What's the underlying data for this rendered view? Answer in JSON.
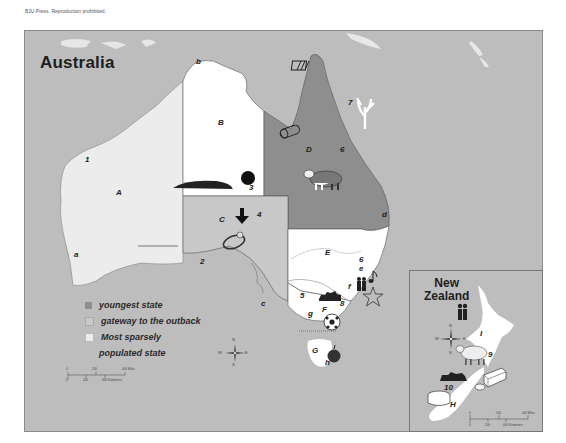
{
  "copyright": "BJU Press. Reproduction prohibited.",
  "map": {
    "title": "Australia",
    "colors": {
      "ocean": "#bdbdbd",
      "youngest_state": "#8e8e8e",
      "gateway_outback": "#c8c8c8",
      "sparsely_populated": "#ececec",
      "white_regions": "#ffffff"
    },
    "region_labels": [
      {
        "id": "A",
        "x": 116,
        "y": 192
      },
      {
        "id": "B",
        "x": 218,
        "y": 122
      },
      {
        "id": "C",
        "x": 219,
        "y": 219
      },
      {
        "id": "D",
        "x": 306,
        "y": 148
      },
      {
        "id": "E",
        "x": 325,
        "y": 250
      },
      {
        "id": "F",
        "x": 322,
        "y": 315
      },
      {
        "id": "G",
        "x": 312,
        "y": 346
      }
    ],
    "lowercase_labels": [
      {
        "id": "a",
        "x": 74,
        "y": 253
      },
      {
        "id": "b",
        "x": 196,
        "y": 60
      },
      {
        "id": "c",
        "x": 260,
        "y": 300
      },
      {
        "id": "d",
        "x": 381,
        "y": 212
      },
      {
        "id": "e",
        "x": 367,
        "y": 269
      },
      {
        "id": "f",
        "x": 347,
        "y": 284
      },
      {
        "id": "g",
        "x": 308,
        "y": 313
      },
      {
        "id": "h",
        "x": 325,
        "y": 362
      }
    ],
    "number_labels": [
      {
        "id": "1",
        "x": 84,
        "y": 159
      },
      {
        "id": "2",
        "x": 200,
        "y": 260
      },
      {
        "id": "3",
        "x": 250,
        "y": 186
      },
      {
        "id": "4",
        "x": 256,
        "y": 213
      },
      {
        "id": "5",
        "x": 299,
        "y": 293
      },
      {
        "id": "6",
        "x": 340,
        "y": 148
      },
      {
        "id": "6b",
        "label": "6",
        "x": 359,
        "y": 260
      },
      {
        "id": "7",
        "x": 348,
        "y": 101
      },
      {
        "id": "8",
        "x": 339,
        "y": 301
      },
      {
        "id": "e2",
        "label": "e",
        "x": 365,
        "y": 266
      }
    ],
    "icons": [
      "fence-icon",
      "log-icon",
      "coral-icon",
      "ayers-rock-icon",
      "arrow-down-icon",
      "opal-ring-icon",
      "cattle-icon",
      "sheep-icon",
      "people-icon",
      "music-note-icon",
      "star-icon",
      "soccer-ball-icon",
      "apple-icon",
      "cheese-icon",
      "butter-icon",
      "mountain-icon"
    ]
  },
  "legend": {
    "items": [
      {
        "label": "youngest state",
        "color": "#8e8e8e"
      },
      {
        "label": "gateway to the outback",
        "color": "#c8c8c8"
      },
      {
        "label": "Most sparsely",
        "label_cont": "populated state",
        "color": "#ececec"
      }
    ]
  },
  "compass": {
    "n": "N",
    "s": "S",
    "e": "E",
    "w": "W"
  },
  "scale": {
    "miles": [
      "0",
      "200",
      "400 Miles"
    ],
    "km": [
      "0",
      "200",
      "400 Kilometers"
    ]
  },
  "nz_inset": {
    "title_line1": "New",
    "title_line2": "Zealand",
    "labels": [
      {
        "id": "I",
        "x": 72,
        "y": 63
      },
      {
        "id": "9",
        "x": 79,
        "y": 83
      },
      {
        "id": "10",
        "x": 35,
        "y": 116
      },
      {
        "id": "H",
        "x": 40,
        "y": 133
      }
    ],
    "compass": {
      "n": "N",
      "s": "S",
      "e": "E",
      "w": "W"
    },
    "scale": {
      "miles": [
        "0",
        "200",
        "400 Miles"
      ],
      "km": [
        "0",
        "200",
        "400 Kilometers"
      ]
    }
  }
}
